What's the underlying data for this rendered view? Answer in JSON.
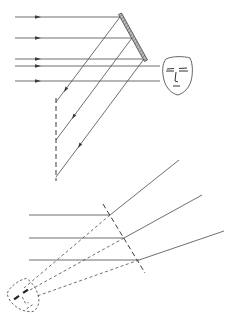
{
  "figure": {
    "colors": {
      "line": "#4a4a4a",
      "mirror_fill": "#9a9a9a",
      "background": "#ffffff"
    },
    "upper_panel": {
      "incident_rays_y": [
        17,
        38,
        59,
        66,
        81
      ],
      "incident_ray_start_x": 15,
      "arrow_x": 38,
      "mirror": {
        "x1": 120,
        "y1": 14,
        "x2": 146,
        "y2": 61,
        "style": "hatched-solid"
      },
      "reflection_points": [
        [
          120,
          17
        ],
        [
          132,
          38
        ],
        [
          144,
          59
        ]
      ],
      "reflected_ray_ends": [
        [
          56,
          102
        ],
        [
          56,
          140
        ],
        [
          56,
          177
        ]
      ],
      "image_plane": {
        "x": 56,
        "y1": 98,
        "y2": 180,
        "style": "dashed"
      },
      "observer_face": {
        "x": 162,
        "y": 57,
        "w": 31,
        "h": 38,
        "icon": "face-icon"
      }
    },
    "lower_panel": {
      "mirror": {
        "x1": 103,
        "y1": 204,
        "x2": 145,
        "y2": 273,
        "style": "dashed"
      },
      "horizontal_rays_y": [
        215,
        238,
        260
      ],
      "horizontal_ray_start_x": 29,
      "intersections": [
        [
          110,
          215
        ],
        [
          124,
          238
        ],
        [
          139,
          260
        ]
      ],
      "outgoing_ray_ends": [
        [
          179,
          160
        ],
        [
          202,
          195
        ],
        [
          224,
          231
        ]
      ],
      "virtual_face": {
        "cx": 24,
        "cy": 296,
        "icon": "virtual-face-icon",
        "style": "dashed"
      }
    }
  }
}
